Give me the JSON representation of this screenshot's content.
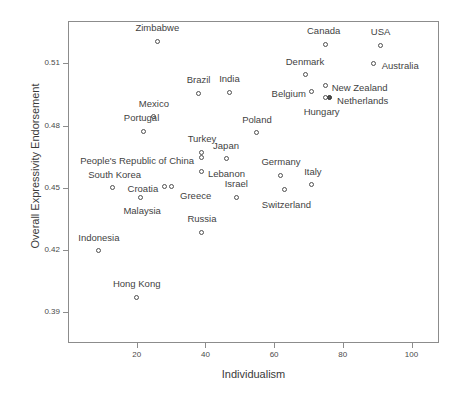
{
  "chart_data": {
    "type": "scatter",
    "title": "",
    "xlabel": "Individualism",
    "ylabel": "Overall Expressivity Endorsement",
    "xlim": [
      0,
      108
    ],
    "ylim": [
      0.375,
      0.5305
    ],
    "xticks": [
      20,
      40,
      60,
      80,
      100
    ],
    "xtick_labels": [
      "20",
      "40",
      "60",
      "80",
      "100"
    ],
    "yticks": [
      0.51,
      0.48,
      0.45,
      0.42,
      0.39
    ],
    "ytick_labels": [
      "0.51",
      "0.48",
      "0.45",
      "0.42",
      "0.39"
    ],
    "grid": false,
    "legend": null,
    "marker": "open-circle",
    "points": [
      {
        "label": "Zimbabwe",
        "x": 26,
        "y": 0.5205,
        "label_dx": 0,
        "label_dy": -14,
        "anchor": "center",
        "filled": false
      },
      {
        "label": "Canada",
        "x": 75,
        "y": 0.519,
        "label_dx": -2,
        "label_dy": -14,
        "anchor": "center",
        "filled": false
      },
      {
        "label": "USA",
        "x": 91,
        "y": 0.5185,
        "label_dx": 0,
        "label_dy": -14,
        "anchor": "center",
        "filled": false
      },
      {
        "label": "Australia",
        "x": 89,
        "y": 0.51,
        "label_dx": 8,
        "label_dy": 3,
        "anchor": "start",
        "filled": false
      },
      {
        "label": "Denmark",
        "x": 69,
        "y": 0.5045,
        "label_dx": 0,
        "label_dy": -13,
        "anchor": "center",
        "filled": false
      },
      {
        "label": "Brazil",
        "x": 38,
        "y": 0.4955,
        "label_dx": 0,
        "label_dy": -13,
        "anchor": "center",
        "filled": false
      },
      {
        "label": "India",
        "x": 47,
        "y": 0.496,
        "label_dx": 0,
        "label_dy": -13,
        "anchor": "center",
        "filled": false
      },
      {
        "label": "New Zealand",
        "x": 75,
        "y": 0.4995,
        "label_dx": 6,
        "label_dy": 3,
        "anchor": "start",
        "filled": false
      },
      {
        "label": "Belgium",
        "x": 71,
        "y": 0.4965,
        "label_dx": -6,
        "label_dy": 3,
        "anchor": "end",
        "filled": false
      },
      {
        "label": "Netherlands",
        "x": 76,
        "y": 0.4935,
        "label_dx": 8,
        "label_dy": 3,
        "anchor": "start",
        "filled": true
      },
      {
        "label": "Hungary",
        "x": 75,
        "y": 0.4935,
        "label_dx": -4,
        "label_dy": 14,
        "anchor": "center",
        "filled": false
      },
      {
        "label": "Mexico",
        "x": 25,
        "y": 0.4842,
        "label_dx": 0,
        "label_dy": -13,
        "anchor": "center",
        "filled": false
      },
      {
        "label": "Portugal",
        "x": 22,
        "y": 0.4772,
        "label_dx": -2,
        "label_dy": -13,
        "anchor": "center",
        "filled": false
      },
      {
        "label": "Poland",
        "x": 55,
        "y": 0.4765,
        "label_dx": 0,
        "label_dy": -13,
        "anchor": "center",
        "filled": false
      },
      {
        "label": "Turkey",
        "x": 39,
        "y": 0.4672,
        "label_dx": 0,
        "label_dy": -13,
        "anchor": "center",
        "filled": false
      },
      {
        "label": "People's Republic of China",
        "x": 39,
        "y": 0.4645,
        "label_dx": -8,
        "label_dy": 3,
        "anchor": "end",
        "filled": false
      },
      {
        "label": "Japan",
        "x": 46,
        "y": 0.464,
        "label_dx": 0,
        "label_dy": -13,
        "anchor": "center",
        "filled": false
      },
      {
        "label": "Lebanon",
        "x": 39,
        "y": 0.458,
        "label_dx": 6,
        "label_dy": 3,
        "anchor": "start",
        "filled": false
      },
      {
        "label": "Germany",
        "x": 62,
        "y": 0.456,
        "label_dx": 0,
        "label_dy": -13,
        "anchor": "center",
        "filled": false
      },
      {
        "label": "Italy",
        "x": 71,
        "y": 0.4515,
        "label_dx": 1,
        "label_dy": -13,
        "anchor": "center",
        "filled": false
      },
      {
        "label": "South Korea",
        "x": 13,
        "y": 0.45,
        "label_dx": 2,
        "label_dy": -13,
        "anchor": "center",
        "filled": false
      },
      {
        "label": "Croatia",
        "x": 28,
        "y": 0.4505,
        "label_dx": -6,
        "label_dy": 2,
        "anchor": "end",
        "filled": false
      },
      {
        "label": "Greece",
        "x": 30,
        "y": 0.4505,
        "label_dx": 9,
        "label_dy": 9,
        "anchor": "start",
        "filled": false
      },
      {
        "label": "Switzerland",
        "x": 63,
        "y": 0.449,
        "label_dx": 2,
        "label_dy": 15,
        "anchor": "center",
        "filled": false
      },
      {
        "label": "Malaysia",
        "x": 21,
        "y": 0.4455,
        "label_dx": 2,
        "label_dy": 14,
        "anchor": "center",
        "filled": false
      },
      {
        "label": "Israel",
        "x": 49,
        "y": 0.4455,
        "label_dx": 0,
        "label_dy": -13,
        "anchor": "center",
        "filled": false
      },
      {
        "label": "Russia",
        "x": 39,
        "y": 0.4285,
        "label_dx": 0,
        "label_dy": -13,
        "anchor": "center",
        "filled": false
      },
      {
        "label": "Indonesia",
        "x": 9,
        "y": 0.4196,
        "label_dx": 0,
        "label_dy": -13,
        "anchor": "center",
        "filled": false
      },
      {
        "label": "Hong Kong",
        "x": 20,
        "y": 0.397,
        "label_dx": 0,
        "label_dy": -13,
        "anchor": "center",
        "filled": false
      }
    ]
  }
}
